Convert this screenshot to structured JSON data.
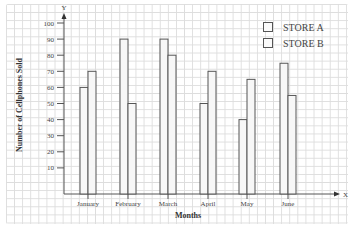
{
  "chart_data": {
    "type": "bar",
    "title": "",
    "xlabel": "Months",
    "ylabel": "Number of Cellphones Sold",
    "x_axis_letter": "X",
    "y_axis_letter": "Y",
    "categories": [
      "January",
      "February",
      "March",
      "April",
      "May",
      "June"
    ],
    "series": [
      {
        "name": "STORE A",
        "values": [
          60,
          90,
          90,
          50,
          40,
          75
        ]
      },
      {
        "name": "STORE B",
        "values": [
          70,
          50,
          80,
          70,
          65,
          55
        ]
      }
    ],
    "yticks": [
      10,
      20,
      30,
      40,
      50,
      60,
      70,
      80,
      90,
      100
    ],
    "ylim": [
      0,
      100
    ],
    "grid": true,
    "legend_position": "top-right"
  },
  "colors": {
    "bar_fill": "#f7f7f7",
    "bar_stroke": "#555555",
    "grid": "#dddddd",
    "axis": "#555555"
  }
}
